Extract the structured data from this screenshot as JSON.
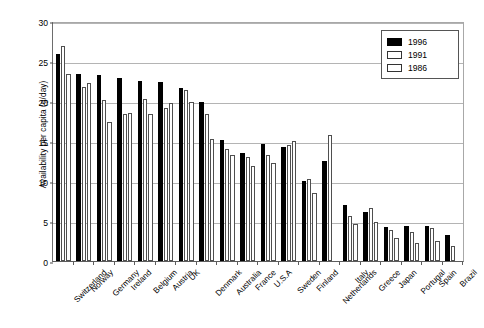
{
  "chart_data": {
    "type": "bar",
    "title": "",
    "xlabel": "",
    "ylabel": "Availability per capita (g/day)",
    "ylim": [
      0,
      30
    ],
    "yticks": [
      0,
      5,
      10,
      15,
      20,
      25,
      30
    ],
    "ytick_labels": [
      "0",
      "5",
      "10",
      "15",
      "20",
      "25",
      "30"
    ],
    "grid": true,
    "legend_position": "top-right",
    "categories": [
      "Switzerland",
      "Norway",
      "Germany",
      "Ireland",
      "Belgium",
      "Austria",
      "UK",
      "Denmark",
      "Australia",
      "France",
      "U.S.A",
      "Sweden",
      "Finland",
      "Netherlands",
      "Italy",
      "Greece",
      "Japan",
      "Portugal",
      "Spain",
      "Brazil"
    ],
    "series": [
      {
        "name": "1996",
        "color": "#000000",
        "values": [
          25.9,
          23.4,
          23.2,
          22.9,
          22.5,
          22.4,
          21.6,
          19.9,
          15.1,
          13.5,
          14.6,
          14.3,
          10.0,
          12.5,
          7.0,
          6.1,
          4.3,
          4.4,
          4.4,
          3.2
        ]
      },
      {
        "name": "1991",
        "color": "#ffffff",
        "values": [
          26.9,
          21.8,
          20.1,
          18.4,
          20.2,
          19.1,
          21.4,
          18.4,
          14.0,
          13.0,
          13.3,
          14.5,
          10.3,
          15.7,
          5.6,
          6.6,
          3.9,
          3.6,
          4.1,
          1.9
        ]
      },
      {
        "name": "1986",
        "color": "#ffffff",
        "values": [
          23.4,
          22.2,
          17.4,
          18.5,
          18.4,
          19.7,
          19.9,
          15.3,
          13.3,
          11.9,
          12.2,
          15.0,
          8.5,
          null,
          4.6,
          4.9,
          2.9,
          2.3,
          2.5,
          null
        ]
      }
    ]
  },
  "legend": {
    "entries": [
      {
        "label": "1996"
      },
      {
        "label": "1991"
      },
      {
        "label": "1986"
      }
    ]
  }
}
